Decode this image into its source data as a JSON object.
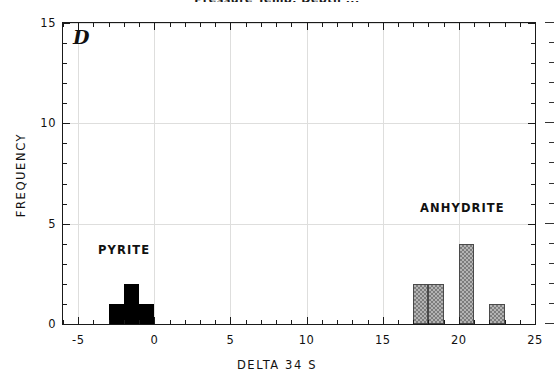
{
  "figure": {
    "cut_off_title": "Pressure Temp. Depth ...",
    "panel_letter": "D"
  },
  "axes": {
    "x_title": "DELTA 34 S",
    "y_title": "FREQUENCY",
    "x_ticks": [
      "-5",
      "0",
      "5",
      "10",
      "15",
      "20",
      "25"
    ],
    "y_ticks": [
      "0",
      "5",
      "10",
      "15"
    ]
  },
  "annotations": {
    "pyrite": "PYRITE",
    "anhydrite": "ANHYDRITE"
  },
  "colors": {
    "pyrite_fill": "#000000",
    "anhydrite_fill": "#b4b4b4",
    "anhydrite_edge": "#4a4a4a",
    "axis": "#1a1a1a",
    "grid": "#dededd"
  },
  "chart_data": {
    "type": "bar",
    "title": "Pressure Temp. Depth ...",
    "xlabel": "DELTA 34 S",
    "ylabel": "FREQUENCY",
    "xlim": [
      -6,
      25
    ],
    "ylim": [
      0,
      15
    ],
    "grid": true,
    "legend_position": "inline-annotation",
    "bin_width": 1,
    "series": [
      {
        "name": "PYRITE",
        "fill": "solid-black",
        "bins": [
          -3,
          -2,
          -1
        ],
        "values": [
          1,
          2,
          1
        ]
      },
      {
        "name": "ANHYDRITE",
        "fill": "gray-checkered",
        "bins": [
          17,
          18,
          20,
          22
        ],
        "values": [
          2,
          2,
          4,
          1
        ]
      }
    ],
    "x_tick_values": [
      -5,
      0,
      5,
      10,
      15,
      20,
      25
    ],
    "y_tick_values": [
      0,
      5,
      10,
      15
    ],
    "x_minor_tick_interval": 1,
    "y_minor_tick_interval": 1
  }
}
